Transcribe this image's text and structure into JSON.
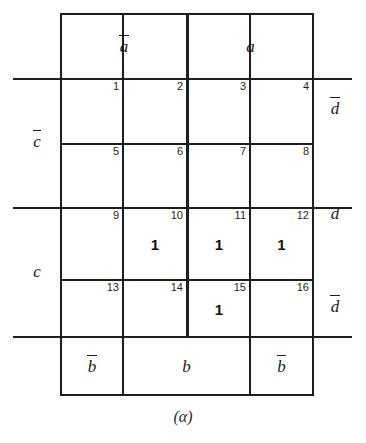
{
  "figure": {
    "type": "karnaugh-map",
    "caption": "(α)",
    "variables": [
      "a",
      "b",
      "c",
      "d"
    ],
    "cell_count": 16
  },
  "column_headers": [
    {
      "id": "col-header-a-bar",
      "text": "a",
      "complemented": true,
      "spans_columns": [
        1,
        2
      ]
    },
    {
      "id": "col-header-a",
      "text": "a",
      "complemented": false,
      "spans_columns": [
        3,
        4
      ]
    }
  ],
  "bottom_headers": [
    {
      "id": "bottom-header-b-bar-left",
      "text": "b",
      "complemented": true,
      "spans_columns": [
        1
      ]
    },
    {
      "id": "bottom-header-b",
      "text": "b",
      "complemented": false,
      "spans_columns": [
        2,
        3
      ]
    },
    {
      "id": "bottom-header-b-bar-right",
      "text": "b",
      "complemented": true,
      "spans_columns": [
        4
      ]
    }
  ],
  "left_labels": [
    {
      "id": "left-label-c-bar",
      "text": "c",
      "complemented": true,
      "spans_rows": [
        1,
        2
      ]
    },
    {
      "id": "left-label-c",
      "text": "c",
      "complemented": false,
      "spans_rows": [
        3,
        4
      ]
    }
  ],
  "right_labels": [
    {
      "id": "right-label-d-bar-top",
      "text": "d",
      "complemented": true,
      "spans_rows": [
        1
      ]
    },
    {
      "id": "right-label-d",
      "text": "d",
      "complemented": false,
      "spans_rows": [
        2,
        3
      ]
    },
    {
      "id": "right-label-d-bar-bottom",
      "text": "d",
      "complemented": true,
      "spans_rows": [
        4
      ]
    }
  ],
  "cells": [
    {
      "number": "1",
      "value": "",
      "row": 1,
      "col": 1
    },
    {
      "number": "2",
      "value": "",
      "row": 1,
      "col": 2
    },
    {
      "number": "3",
      "value": "",
      "row": 1,
      "col": 3
    },
    {
      "number": "4",
      "value": "",
      "row": 1,
      "col": 4
    },
    {
      "number": "5",
      "value": "",
      "row": 2,
      "col": 1
    },
    {
      "number": "6",
      "value": "",
      "row": 2,
      "col": 2
    },
    {
      "number": "7",
      "value": "",
      "row": 2,
      "col": 3
    },
    {
      "number": "8",
      "value": "",
      "row": 2,
      "col": 4
    },
    {
      "number": "9",
      "value": "",
      "row": 3,
      "col": 1
    },
    {
      "number": "10",
      "value": "1",
      "row": 3,
      "col": 2
    },
    {
      "number": "11",
      "value": "1",
      "row": 3,
      "col": 3
    },
    {
      "number": "12",
      "value": "1",
      "row": 3,
      "col": 4
    },
    {
      "number": "13",
      "value": "",
      "row": 4,
      "col": 1
    },
    {
      "number": "14",
      "value": "",
      "row": 4,
      "col": 2
    },
    {
      "number": "15",
      "value": "1",
      "row": 4,
      "col": 3
    },
    {
      "number": "16",
      "value": "",
      "row": 4,
      "col": 4
    }
  ],
  "colors": {
    "ink": "#1d1d1d",
    "background": "#ffffff"
  }
}
